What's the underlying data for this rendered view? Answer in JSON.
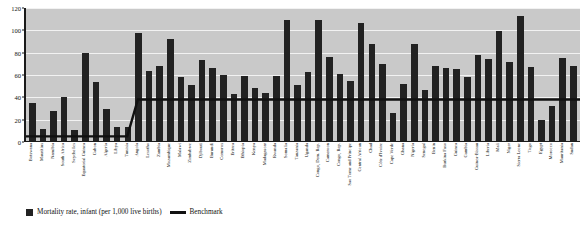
{
  "chart_data": {
    "type": "bar",
    "title": "",
    "xlabel": "",
    "ylabel": "",
    "ylim": [
      0,
      120
    ],
    "yticks": [
      0,
      20,
      40,
      60,
      80,
      100,
      120
    ],
    "grid": true,
    "legend_position": "bottom-left",
    "legend": [
      "Mortality rate, infant (per 1,000 live births)",
      "Benchmark"
    ],
    "categories": [
      "Botswana",
      "Mauritius",
      "Namibia",
      "South Africa",
      "Seychelles",
      "Equatorial Guinea",
      "Gabon",
      "Algeria",
      "Libya",
      "Tunisia",
      "Angola",
      "Lesotho",
      "Zambia",
      "Mozambique",
      "Malawi",
      "Zimbabwe",
      "Djibouti",
      "Burundi",
      "Comoros",
      "Eritrea",
      "Ethiopia",
      "Kenya",
      "Madagascar",
      "Rwanda",
      "Somalia",
      "Tanzania",
      "Uganda",
      "Congo, Dem. Rep.",
      "Cameroon",
      "Congo, Rep.",
      "Sao Tome and Principe",
      "Central African",
      "Chad",
      "Côte d'Ivoire",
      "Cape Verde",
      "Ghana",
      "Nigeria",
      "Senegal",
      "Benin",
      "Burkina Faso",
      "Guinea",
      "Gambia",
      "Guinea-Bissau",
      "Liberia",
      "Mali",
      "Niger",
      "Sierra Leone",
      "Togo",
      "Egypt",
      "Morocco",
      "Mauritania",
      "Sudan"
    ],
    "series": [
      {
        "name": "Mortality rate, infant (per 1,000 live births)",
        "values": [
          35,
          12,
          28,
          40,
          11,
          80,
          54,
          30,
          13,
          13,
          98,
          64,
          68,
          92,
          58,
          51,
          73,
          66,
          60,
          43,
          59,
          48,
          44,
          59,
          109,
          51,
          63,
          109,
          76,
          61,
          55,
          107,
          88,
          70,
          26,
          52,
          88,
          47,
          68,
          66,
          65,
          58,
          78,
          74,
          99,
          72,
          113,
          67,
          20,
          32,
          75,
          68
        ]
      }
    ],
    "benchmark": {
      "name": "Benchmark",
      "low_value": 5,
      "high_value": 38,
      "step_at_category": "Angola"
    }
  }
}
